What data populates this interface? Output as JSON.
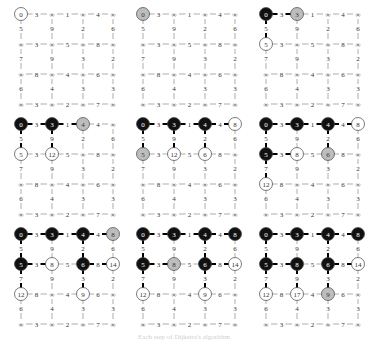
{
  "diagram": {
    "grid": {
      "rows": 4,
      "cols": 4
    },
    "horizontal_weights": [
      [
        3,
        1,
        4
      ],
      [
        3,
        5,
        8
      ],
      [
        8,
        4,
        6
      ],
      [
        3,
        2,
        7
      ]
    ],
    "vertical_weights": [
      [
        5,
        9,
        2,
        6
      ],
      [
        7,
        9,
        3,
        2
      ],
      [
        6,
        4,
        3,
        3
      ]
    ],
    "infinity_symbol": "∞",
    "colors": {
      "visited": "#111111",
      "current": "#bdbdbd",
      "frontier": "#ffffff",
      "edge": "#555555",
      "tree_edge": "#000000"
    },
    "panels": [
      {
        "step": 1,
        "dist": [
          [
            "0",
            "∞",
            "∞",
            "∞"
          ],
          [
            "∞",
            "∞",
            "∞",
            "∞"
          ],
          [
            "∞",
            "∞",
            "∞",
            "∞"
          ],
          [
            "∞",
            "∞",
            "∞",
            "∞"
          ]
        ],
        "state": [
          [
            "F",
            "",
            "",
            ""
          ],
          [
            "",
            "",
            "",
            ""
          ],
          [
            "",
            "",
            "",
            ""
          ],
          [
            "",
            "",
            "",
            ""
          ]
        ],
        "tree_edges": []
      },
      {
        "step": 2,
        "dist": [
          [
            "0",
            "∞",
            "∞",
            "∞"
          ],
          [
            "∞",
            "∞",
            "∞",
            "∞"
          ],
          [
            "∞",
            "∞",
            "∞",
            "∞"
          ],
          [
            "∞",
            "∞",
            "∞",
            "∞"
          ]
        ],
        "state": [
          [
            "C",
            "",
            "",
            ""
          ],
          [
            "",
            "",
            "",
            ""
          ],
          [
            "",
            "",
            "",
            ""
          ],
          [
            "",
            "",
            "",
            ""
          ]
        ],
        "tree_edges": []
      },
      {
        "step": 3,
        "dist": [
          [
            "0",
            "3",
            "∞",
            "∞"
          ],
          [
            "5",
            "∞",
            "∞",
            "∞"
          ],
          [
            "∞",
            "∞",
            "∞",
            "∞"
          ],
          [
            "∞",
            "∞",
            "∞",
            "∞"
          ]
        ],
        "state": [
          [
            "V",
            "C",
            "",
            ""
          ],
          [
            "F",
            "",
            "",
            ""
          ],
          [
            "",
            "",
            "",
            ""
          ],
          [
            "",
            "",
            "",
            ""
          ]
        ],
        "tree_edges": [
          [
            "h",
            0,
            0
          ],
          [
            "v",
            0,
            0
          ]
        ]
      },
      {
        "step": 4,
        "dist": [
          [
            "0",
            "3",
            "4",
            "∞"
          ],
          [
            "5",
            "12",
            "∞",
            "∞"
          ],
          [
            "∞",
            "∞",
            "∞",
            "∞"
          ],
          [
            "∞",
            "∞",
            "∞",
            "∞"
          ]
        ],
        "state": [
          [
            "V",
            "V",
            "C",
            ""
          ],
          [
            "F",
            "F",
            "",
            ""
          ],
          [
            "",
            "",
            "",
            ""
          ],
          [
            "",
            "",
            "",
            ""
          ]
        ],
        "tree_edges": [
          [
            "h",
            0,
            0
          ],
          [
            "h",
            0,
            1
          ],
          [
            "v",
            0,
            0
          ],
          [
            "v",
            0,
            1
          ]
        ]
      },
      {
        "step": 5,
        "dist": [
          [
            "0",
            "3",
            "4",
            "8"
          ],
          [
            "5",
            "12",
            "6",
            "∞"
          ],
          [
            "∞",
            "∞",
            "∞",
            "∞"
          ],
          [
            "∞",
            "∞",
            "∞",
            "∞"
          ]
        ],
        "state": [
          [
            "V",
            "V",
            "V",
            "F"
          ],
          [
            "C",
            "F",
            "F",
            ""
          ],
          [
            "",
            "",
            "",
            ""
          ],
          [
            "",
            "",
            "",
            ""
          ]
        ],
        "tree_edges": [
          [
            "h",
            0,
            0
          ],
          [
            "h",
            0,
            1
          ],
          [
            "h",
            0,
            2
          ],
          [
            "v",
            0,
            0
          ],
          [
            "v",
            0,
            1
          ],
          [
            "v",
            0,
            2
          ]
        ]
      },
      {
        "step": 6,
        "dist": [
          [
            "0",
            "3",
            "4",
            "8"
          ],
          [
            "5",
            "8",
            "6",
            "∞"
          ],
          [
            "12",
            "∞",
            "∞",
            "∞"
          ],
          [
            "∞",
            "∞",
            "∞",
            "∞"
          ]
        ],
        "state": [
          [
            "V",
            "V",
            "V",
            "F"
          ],
          [
            "V",
            "F",
            "C",
            ""
          ],
          [
            "F",
            "",
            "",
            ""
          ],
          [
            "",
            "",
            "",
            ""
          ]
        ],
        "tree_edges": [
          [
            "h",
            0,
            0
          ],
          [
            "h",
            0,
            1
          ],
          [
            "h",
            0,
            2
          ],
          [
            "v",
            0,
            0
          ],
          [
            "v",
            0,
            2
          ],
          [
            "h",
            1,
            0
          ],
          [
            "v",
            1,
            0
          ]
        ]
      },
      {
        "step": 7,
        "dist": [
          [
            "0",
            "3",
            "4",
            "8"
          ],
          [
            "5",
            "8",
            "6",
            "14"
          ],
          [
            "12",
            "∞",
            "9",
            "∞"
          ],
          [
            "∞",
            "∞",
            "∞",
            "∞"
          ]
        ],
        "state": [
          [
            "V",
            "V",
            "V",
            "C"
          ],
          [
            "V",
            "F",
            "V",
            "F"
          ],
          [
            "F",
            "",
            "F",
            ""
          ],
          [
            "",
            "",
            "",
            ""
          ]
        ],
        "tree_edges": [
          [
            "h",
            0,
            0
          ],
          [
            "h",
            0,
            1
          ],
          [
            "h",
            0,
            2
          ],
          [
            "v",
            0,
            0
          ],
          [
            "v",
            0,
            2
          ],
          [
            "h",
            1,
            0
          ],
          [
            "v",
            1,
            0
          ],
          [
            "h",
            1,
            2
          ],
          [
            "v",
            1,
            2
          ]
        ]
      },
      {
        "step": 8,
        "dist": [
          [
            "0",
            "3",
            "4",
            "8"
          ],
          [
            "5",
            "8",
            "6",
            "14"
          ],
          [
            "12",
            "∞",
            "9",
            "∞"
          ],
          [
            "∞",
            "∞",
            "∞",
            "∞"
          ]
        ],
        "state": [
          [
            "V",
            "V",
            "V",
            "V"
          ],
          [
            "V",
            "C",
            "V",
            "F"
          ],
          [
            "F",
            "",
            "F",
            ""
          ],
          [
            "",
            "",
            "",
            ""
          ]
        ],
        "tree_edges": [
          [
            "h",
            0,
            0
          ],
          [
            "h",
            0,
            1
          ],
          [
            "h",
            0,
            2
          ],
          [
            "v",
            0,
            0
          ],
          [
            "v",
            0,
            2
          ],
          [
            "h",
            1,
            0
          ],
          [
            "v",
            1,
            0
          ],
          [
            "h",
            1,
            2
          ],
          [
            "v",
            1,
            2
          ]
        ]
      },
      {
        "step": 9,
        "dist": [
          [
            "0",
            "3",
            "4",
            "8"
          ],
          [
            "5",
            "8",
            "6",
            "14"
          ],
          [
            "12",
            "17",
            "9",
            "∞"
          ],
          [
            "∞",
            "∞",
            "∞",
            "∞"
          ]
        ],
        "state": [
          [
            "V",
            "V",
            "V",
            "V"
          ],
          [
            "V",
            "V",
            "V",
            "F"
          ],
          [
            "F",
            "F",
            "C",
            ""
          ],
          [
            "",
            "",
            "",
            ""
          ]
        ],
        "tree_edges": [
          [
            "h",
            0,
            0
          ],
          [
            "h",
            0,
            1
          ],
          [
            "h",
            0,
            2
          ],
          [
            "v",
            0,
            0
          ],
          [
            "v",
            0,
            2
          ],
          [
            "h",
            1,
            0
          ],
          [
            "v",
            1,
            0
          ],
          [
            "h",
            1,
            2
          ],
          [
            "v",
            1,
            2
          ],
          [
            "v",
            1,
            1
          ]
        ]
      }
    ],
    "caption": "Each step of Dijkstra's algorithm"
  }
}
